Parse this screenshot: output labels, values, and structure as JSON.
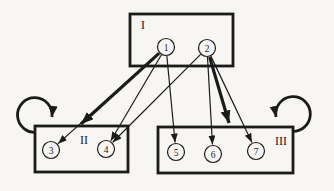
{
  "figure": {
    "background_color": "#f7f6f3",
    "ink_color": "#1b1b1b",
    "node_fill_color": "#f7f6f3",
    "boxes": [
      {
        "id": "I",
        "label": "I",
        "x": 130,
        "y": 14,
        "w": 103,
        "h": 52,
        "label_x": 143,
        "label_y": 25
      },
      {
        "id": "II",
        "label": "II",
        "x": 35,
        "y": 126,
        "w": 93,
        "h": 46,
        "label_x": 84,
        "label_y": 140
      },
      {
        "id": "III",
        "label": "III",
        "x": 158,
        "y": 127,
        "w": 135,
        "h": 46,
        "label_x": 281,
        "label_y": 141
      }
    ],
    "nodes": [
      {
        "id": "1",
        "label": "1",
        "cx": 166,
        "cy": 47,
        "r": 8.5
      },
      {
        "id": "2",
        "label": "2",
        "cx": 207,
        "cy": 48,
        "r": 8.5
      },
      {
        "id": "3",
        "label": "3",
        "cx": 51,
        "cy": 150,
        "r": 8.5
      },
      {
        "id": "4",
        "label": "4",
        "cx": 106,
        "cy": 149,
        "r": 8.5
      },
      {
        "id": "5",
        "label": "5",
        "cx": 176,
        "cy": 152,
        "r": 8.5
      },
      {
        "id": "6",
        "label": "6",
        "cx": 213,
        "cy": 154,
        "r": 8.5
      },
      {
        "id": "7",
        "label": "7",
        "cx": 256,
        "cy": 151,
        "r": 8.5
      }
    ],
    "edges": [
      {
        "from": "1",
        "to": "3",
        "style": "thin"
      },
      {
        "from": "1",
        "to": "4",
        "style": "thin"
      },
      {
        "from": "1",
        "to": "5",
        "style": "thin"
      },
      {
        "from": "2",
        "to": "4",
        "style": "thin"
      },
      {
        "from": "2",
        "to": "6",
        "style": "thin"
      },
      {
        "from": "2",
        "to": "7",
        "style": "thin"
      },
      {
        "from": "1",
        "to": "box-II",
        "style": "thick",
        "end_x": 81,
        "end_y": 124
      },
      {
        "from": "2",
        "to": "box-III",
        "style": "thick",
        "end_x": 229,
        "end_y": 123
      }
    ],
    "loops": [
      {
        "on": "II",
        "side": "left",
        "path": "M 38 132 A 17.3 17.3 0 1 1 52 117"
      },
      {
        "on": "III",
        "side": "right",
        "path": "M 290 131 A 17.3 17.3 0 1 0 276 117"
      }
    ]
  }
}
